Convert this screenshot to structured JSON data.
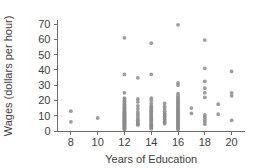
{
  "chart_data": {
    "type": "scatter",
    "title": "",
    "xlabel": "Years of Education",
    "ylabel": "Wages (dollars per hour)",
    "xlim": [
      7,
      21
    ],
    "ylim": [
      0,
      72
    ],
    "xticks": [
      8,
      10,
      12,
      14,
      16,
      18,
      20
    ],
    "xticklabels": [
      "8",
      "10",
      "12",
      "14",
      "16",
      "18",
      "20"
    ],
    "yticks": [
      0,
      10,
      20,
      30,
      40,
      50,
      60,
      70
    ],
    "yticklabels": [
      "0",
      "10",
      "20",
      "30",
      "40",
      "50",
      "60",
      "70"
    ],
    "grid": false,
    "legend": null,
    "marker_color": "#8c8c8c",
    "axis_color": "#6a6a6a",
    "text_color": "#3d3d3d",
    "background": "#ffffff",
    "points": [
      [
        8,
        13.0
      ],
      [
        8,
        6.0
      ],
      [
        10,
        8.5
      ],
      [
        12,
        61.0
      ],
      [
        12,
        37.0
      ],
      [
        12,
        25.0
      ],
      [
        12,
        21.5
      ],
      [
        12,
        20.5
      ],
      [
        12,
        19.5
      ],
      [
        12,
        18.5
      ],
      [
        12,
        17.5
      ],
      [
        12,
        17.0
      ],
      [
        12,
        16.2
      ],
      [
        12,
        15.5
      ],
      [
        12,
        15.0
      ],
      [
        12,
        14.4
      ],
      [
        12,
        13.8
      ],
      [
        12,
        13.2
      ],
      [
        12,
        12.8
      ],
      [
        12,
        12.3
      ],
      [
        12,
        11.8
      ],
      [
        12,
        11.4
      ],
      [
        12,
        11.0
      ],
      [
        12,
        10.6
      ],
      [
        12,
        10.2
      ],
      [
        12,
        9.8
      ],
      [
        12,
        9.4
      ],
      [
        12,
        9.0
      ],
      [
        12,
        8.6
      ],
      [
        12,
        8.2
      ],
      [
        12,
        7.8
      ],
      [
        12,
        7.4
      ],
      [
        12,
        7.0
      ],
      [
        12,
        6.6
      ],
      [
        12,
        6.2
      ],
      [
        12,
        5.8
      ],
      [
        12,
        5.4
      ],
      [
        12,
        5.0
      ],
      [
        12,
        4.6
      ],
      [
        12,
        4.2
      ],
      [
        12,
        3.8
      ],
      [
        12,
        3.4
      ],
      [
        12,
        3.0
      ],
      [
        12,
        2.6
      ],
      [
        12,
        2.2
      ],
      [
        12,
        1.8
      ],
      [
        12,
        1.4
      ],
      [
        12,
        1.0
      ],
      [
        13,
        34.8
      ],
      [
        13,
        21.0
      ],
      [
        13,
        19.0
      ],
      [
        13,
        16.5
      ],
      [
        13,
        14.5
      ],
      [
        13,
        12.5
      ],
      [
        13,
        11.0
      ],
      [
        13,
        9.5
      ],
      [
        13,
        8.0
      ],
      [
        13,
        7.0
      ],
      [
        13,
        6.0
      ],
      [
        13,
        5.2
      ],
      [
        13,
        4.5
      ],
      [
        13,
        4.0
      ],
      [
        14,
        57.5
      ],
      [
        14,
        37.0
      ],
      [
        14,
        21.5
      ],
      [
        14,
        20.0
      ],
      [
        14,
        18.0
      ],
      [
        14,
        16.5
      ],
      [
        14,
        15.5
      ],
      [
        14,
        14.5
      ],
      [
        14,
        13.5
      ],
      [
        14,
        12.8
      ],
      [
        14,
        12.0
      ],
      [
        14,
        11.2
      ],
      [
        14,
        10.5
      ],
      [
        14,
        9.8
      ],
      [
        14,
        9.0
      ],
      [
        14,
        8.2
      ],
      [
        14,
        7.5
      ],
      [
        14,
        6.8
      ],
      [
        14,
        6.0
      ],
      [
        14,
        5.2
      ],
      [
        14,
        4.5
      ],
      [
        14,
        3.8
      ],
      [
        14,
        3.0
      ],
      [
        14,
        2.2
      ],
      [
        14,
        1.5
      ],
      [
        15,
        18.0
      ],
      [
        15,
        16.0
      ],
      [
        15,
        14.5
      ],
      [
        15,
        13.0
      ],
      [
        15,
        11.5
      ],
      [
        15,
        10.5
      ],
      [
        15,
        9.5
      ],
      [
        15,
        8.5
      ],
      [
        15,
        7.5
      ],
      [
        15,
        6.5
      ],
      [
        15,
        5.5
      ],
      [
        15,
        4.8
      ],
      [
        16,
        69.5
      ],
      [
        16,
        31.5
      ],
      [
        16,
        30.0
      ],
      [
        16,
        24.5
      ],
      [
        16,
        23.0
      ],
      [
        16,
        22.0
      ],
      [
        16,
        21.0
      ],
      [
        16,
        20.0
      ],
      [
        16,
        19.2
      ],
      [
        16,
        18.5
      ],
      [
        16,
        17.8
      ],
      [
        16,
        17.0
      ],
      [
        16,
        16.3
      ],
      [
        16,
        15.6
      ],
      [
        16,
        15.0
      ],
      [
        16,
        14.3
      ],
      [
        16,
        13.7
      ],
      [
        16,
        13.0
      ],
      [
        16,
        12.4
      ],
      [
        16,
        11.8
      ],
      [
        16,
        11.2
      ],
      [
        16,
        10.6
      ],
      [
        16,
        10.0
      ],
      [
        16,
        9.4
      ],
      [
        16,
        8.8
      ],
      [
        16,
        8.2
      ],
      [
        16,
        7.6
      ],
      [
        16,
        7.0
      ],
      [
        16,
        6.4
      ],
      [
        16,
        5.8
      ],
      [
        16,
        5.2
      ],
      [
        16,
        4.6
      ],
      [
        16,
        4.0
      ],
      [
        16,
        3.4
      ],
      [
        16,
        2.8
      ],
      [
        16,
        2.2
      ],
      [
        16,
        1.6
      ],
      [
        16,
        1.0
      ],
      [
        17,
        15.0
      ],
      [
        17,
        11.5
      ],
      [
        18,
        59.5
      ],
      [
        18,
        41.0
      ],
      [
        18,
        32.5
      ],
      [
        18,
        28.0
      ],
      [
        18,
        25.0
      ],
      [
        18,
        22.0
      ],
      [
        18,
        10.5
      ],
      [
        18,
        9.0
      ],
      [
        18,
        7.5
      ],
      [
        18,
        6.0
      ],
      [
        18,
        4.5
      ],
      [
        19,
        17.5
      ],
      [
        19,
        11.0
      ],
      [
        20,
        39.0
      ],
      [
        20,
        25.0
      ],
      [
        20,
        23.0
      ],
      [
        20,
        7.0
      ]
    ]
  }
}
